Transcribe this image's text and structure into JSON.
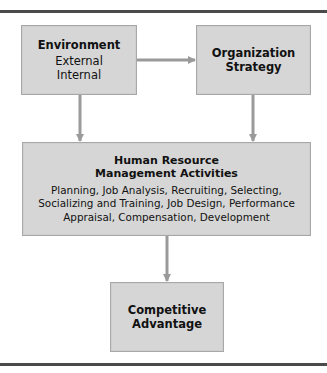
{
  "diagram": {
    "nodes": {
      "environment": {
        "title": "Environment",
        "items": [
          "External",
          "Internal"
        ]
      },
      "strategy": {
        "title_line1": "Organization",
        "title_line2": "Strategy"
      },
      "hrm": {
        "title_line1": "Human Resource",
        "title_line2": "Management Activities",
        "body_line1": "Planning, Job Analysis, Recruiting, Selecting,",
        "body_line2": "Socializing and Training, Job Design, Performance",
        "body_line3": "Appraisal, Compensation, Development"
      },
      "advantage": {
        "title_line1": "Competitive",
        "title_line2": "Advantage"
      }
    },
    "edges": [
      {
        "from": "environment",
        "to": "strategy"
      },
      {
        "from": "environment",
        "to": "hrm"
      },
      {
        "from": "strategy",
        "to": "hrm"
      },
      {
        "from": "hrm",
        "to": "advantage"
      }
    ],
    "colors": {
      "box_fill": "#d6d6d6",
      "box_border": "#a8a8a8",
      "arrow": "#9a9a9a",
      "rule": "#4a4a4a"
    }
  }
}
